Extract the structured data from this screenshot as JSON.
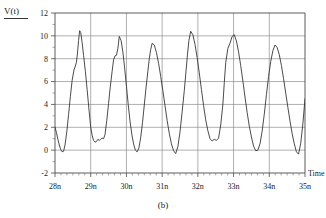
{
  "figure": {
    "caption": "(b)",
    "y_axis_label": "V(t)",
    "x_axis_label": "Time"
  },
  "chart_data": {
    "type": "line",
    "title": "",
    "subtitle": "",
    "xlabel": "Time",
    "ylabel": "V(t)",
    "xlim": [
      28,
      35
    ],
    "ylim": [
      -2,
      12
    ],
    "grid": true,
    "legend_position": "none",
    "x_unit": "n",
    "x_tick_labels": [
      "28n",
      "29n",
      "30n",
      "31n",
      "32n",
      "33n",
      "34n",
      "35n"
    ],
    "x_ticks": [
      28,
      29,
      30,
      31,
      32,
      33,
      34,
      35
    ],
    "y_tick_labels": [
      "-2",
      "0",
      "2",
      "4",
      "6",
      "8",
      "10",
      "12"
    ],
    "y_ticks": [
      -2,
      0,
      2,
      4,
      6,
      8,
      10,
      12
    ],
    "minor_ticks_per_interval": 5,
    "annotations": [],
    "series": [
      {
        "name": "V(t)",
        "color": "#2b2b2b",
        "x": [
          28.0,
          28.04,
          28.08,
          28.12,
          28.16,
          28.2,
          28.24,
          28.28,
          28.33,
          28.38,
          28.43,
          28.48,
          28.53,
          28.57,
          28.6,
          28.63,
          28.66,
          28.69,
          28.72,
          28.76,
          28.8,
          28.85,
          28.9,
          28.95,
          29.0,
          29.04,
          29.08,
          29.12,
          29.16,
          29.2,
          29.24,
          29.28,
          29.32,
          29.36,
          29.4,
          29.45,
          29.5,
          29.55,
          29.6,
          29.64,
          29.68,
          29.72,
          29.76,
          29.8,
          29.85,
          29.9,
          29.95,
          30.0,
          30.05,
          30.1,
          30.15,
          30.2,
          30.25,
          30.3,
          30.35,
          30.4,
          30.45,
          30.5,
          30.55,
          30.6,
          30.64,
          30.68,
          30.72,
          30.78,
          30.84,
          30.9,
          30.96,
          31.02,
          31.08,
          31.14,
          31.2,
          31.26,
          31.32,
          31.38,
          31.44,
          31.5,
          31.56,
          31.62,
          31.67,
          31.71,
          31.75,
          31.8,
          31.86,
          31.92,
          31.98,
          32.04,
          32.1,
          32.16,
          32.22,
          32.28,
          32.34,
          32.4,
          32.46,
          32.52,
          32.58,
          32.64,
          32.7,
          32.74,
          32.78,
          32.84,
          32.9,
          32.96,
          33.02,
          33.08,
          33.14,
          33.2,
          33.26,
          33.32,
          33.38,
          33.44,
          33.5,
          33.56,
          33.62,
          33.68,
          33.74,
          33.8,
          33.86,
          33.92,
          33.98,
          34.04,
          34.1,
          34.16,
          34.22,
          34.28,
          34.34,
          34.4,
          34.46,
          34.52,
          34.58,
          34.64,
          34.7,
          34.76,
          34.82,
          34.88,
          34.94,
          35.0
        ],
        "y": [
          2.0,
          1.55,
          0.95,
          0.45,
          0.05,
          -0.15,
          -0.1,
          0.45,
          1.6,
          3.1,
          4.7,
          6.1,
          7.0,
          7.35,
          7.7,
          8.5,
          9.6,
          10.45,
          10.3,
          9.4,
          8.3,
          6.9,
          5.3,
          3.6,
          2.0,
          1.3,
          0.85,
          0.7,
          0.75,
          0.95,
          0.85,
          0.95,
          1.05,
          1.0,
          1.35,
          2.6,
          4.1,
          5.6,
          6.9,
          7.9,
          8.25,
          8.3,
          8.9,
          9.95,
          9.6,
          8.6,
          7.2,
          5.6,
          4.0,
          2.55,
          1.4,
          0.55,
          0.0,
          -0.15,
          0.2,
          1.1,
          2.4,
          3.95,
          5.5,
          6.9,
          8.0,
          8.8,
          9.35,
          9.2,
          8.55,
          7.6,
          6.45,
          5.2,
          3.9,
          2.6,
          1.45,
          0.55,
          -0.05,
          -0.3,
          0.3,
          1.6,
          3.35,
          5.2,
          6.95,
          8.4,
          9.6,
          10.4,
          10.1,
          9.25,
          8.1,
          6.75,
          5.3,
          3.9,
          2.65,
          1.7,
          1.0,
          0.8,
          0.95,
          0.85,
          1.05,
          2.2,
          4.0,
          5.9,
          7.65,
          8.9,
          9.35,
          9.95,
          10.1,
          9.55,
          8.6,
          7.4,
          6.05,
          4.65,
          3.3,
          2.1,
          1.15,
          0.35,
          -0.05,
          0.0,
          0.55,
          1.65,
          3.15,
          4.85,
          6.45,
          7.75,
          8.7,
          9.2,
          9.0,
          8.35,
          7.4,
          6.25,
          5.0,
          3.75,
          2.55,
          1.45,
          0.55,
          -0.15,
          -0.35,
          0.6,
          2.3,
          4.5
        ]
      }
    ]
  }
}
